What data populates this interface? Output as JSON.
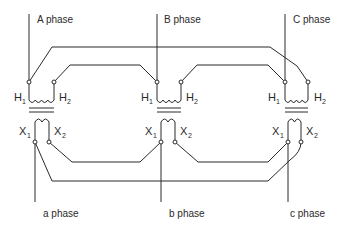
{
  "diagram": {
    "type": "three-phase transformer bank wiring (delta-delta)",
    "primary_phases": [
      {
        "label": "A phase"
      },
      {
        "label": "B phase"
      },
      {
        "label": "C phase"
      }
    ],
    "secondary_phases": [
      {
        "label": "a phase"
      },
      {
        "label": "b phase"
      },
      {
        "label": "c phase"
      }
    ],
    "terminals": {
      "h1_main": "H",
      "h1_sub": "1",
      "h2_main": "H",
      "h2_sub": "2",
      "x1_main": "X",
      "x1_sub": "1",
      "x2_main": "X",
      "x2_sub": "2"
    },
    "transformers": [
      {
        "name": "transformer-1"
      },
      {
        "name": "transformer-2"
      },
      {
        "name": "transformer-3"
      }
    ]
  }
}
